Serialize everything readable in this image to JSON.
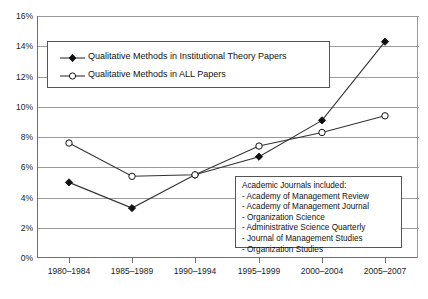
{
  "chart_data": {
    "type": "line",
    "title": "",
    "xlabel": "",
    "ylabel": "",
    "categories": [
      "1980–1984",
      "1985–1989",
      "1990–1994",
      "1995–1999",
      "2000–2004",
      "2005–2007"
    ],
    "series": [
      {
        "name": "Qualitative Methods in Institutional Theory Papers",
        "marker": "filled-diamond",
        "values": [
          5.0,
          3.3,
          5.5,
          6.7,
          9.1,
          14.3
        ]
      },
      {
        "name": "Qualitative Methods in ALL Papers",
        "marker": "open-circle",
        "values": [
          7.6,
          5.4,
          5.5,
          7.4,
          8.3,
          9.4
        ]
      }
    ],
    "ylim": [
      0,
      16
    ],
    "ytick_step": 2,
    "ytick_labels": [
      "0%",
      "2%",
      "4%",
      "6%",
      "8%",
      "10%",
      "12%",
      "14%",
      "16%"
    ],
    "grid": true,
    "legend_position": "upper-left-inside"
  },
  "legend": {
    "entries": [
      {
        "label": "Qualitative Methods in Institutional Theory Papers",
        "marker": "filled-diamond"
      },
      {
        "label": "Qualitative Methods in ALL Papers",
        "marker": "open-circle"
      }
    ]
  },
  "note": {
    "title": "Academic Journals included:",
    "items": [
      "- Academy of Management Review",
      "- Academy of Management Journal",
      "- Organization Science",
      "- Administrative Science Quarterly",
      "- Journal of Management Studies",
      "- Organization Studies"
    ]
  },
  "colors": {
    "series_line": "#333333",
    "gridline": "#9a9a9a",
    "axis": "#6f6f6f",
    "box_border": "#555555",
    "text": "#111111",
    "background": "#ffffff"
  }
}
